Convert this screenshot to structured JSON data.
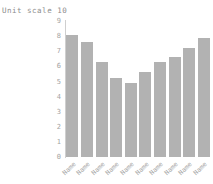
{
  "chart_data": {
    "type": "bar",
    "title": "Unit scale 10",
    "categories": [
      "Name",
      "Name",
      "Name",
      "Name",
      "Name",
      "Name",
      "Name",
      "Name",
      "Name",
      "Name"
    ],
    "values": [
      8.1,
      7.6,
      6.3,
      5.2,
      4.9,
      5.6,
      6.3,
      6.6,
      7.2,
      7.9
    ],
    "xlabel": "",
    "ylabel": "",
    "ylim": [
      0,
      9
    ],
    "ytick_step": 1,
    "yticks": [
      0,
      1,
      2,
      3,
      4,
      5,
      6,
      7,
      8,
      9
    ],
    "grid": false,
    "legend": null,
    "bar_color": "#b2b2b2",
    "axis_color": "#cfcfcf",
    "tick_label_color": "#a3a3a3",
    "title_color": "#8c8c8c"
  }
}
